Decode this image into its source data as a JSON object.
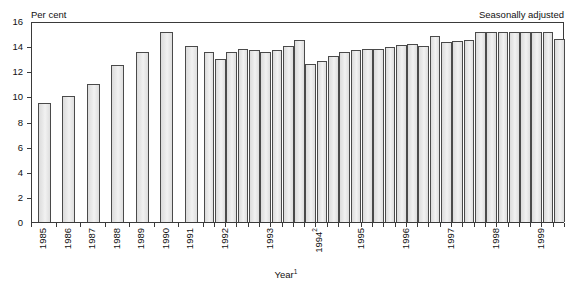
{
  "chart_data": {
    "type": "bar",
    "title": "",
    "note_left": "Per cent",
    "note_right": "Seasonally adjusted",
    "xlabel": "Year",
    "xlabel_superscript": "1",
    "ylabel": "Per cent",
    "ylim": [
      0,
      16
    ],
    "yticks": [
      0,
      2,
      4,
      6,
      8,
      10,
      12,
      14,
      16
    ],
    "ytick_labels": [
      "0",
      "2",
      "4",
      "6",
      "8",
      "10",
      "12",
      "14",
      "16"
    ],
    "grid": false,
    "legend": "none",
    "series_note": "Annual observations 1985-1991, quarterly observations 1992-1999",
    "tick_labels": [
      {
        "label": "1985",
        "superscript": ""
      },
      {
        "label": "1986",
        "superscript": ""
      },
      {
        "label": "1987",
        "superscript": ""
      },
      {
        "label": "1988",
        "superscript": ""
      },
      {
        "label": "1989",
        "superscript": ""
      },
      {
        "label": "1990",
        "superscript": ""
      },
      {
        "label": "1991",
        "superscript": ""
      },
      {
        "label": "1992",
        "superscript": ""
      },
      {
        "label": "1993",
        "superscript": ""
      },
      {
        "label": "1994",
        "superscript": "2"
      },
      {
        "label": "1995",
        "superscript": ""
      },
      {
        "label": "1996",
        "superscript": ""
      },
      {
        "label": "1997",
        "superscript": ""
      },
      {
        "label": "1998",
        "superscript": ""
      },
      {
        "label": "1999",
        "superscript": ""
      }
    ],
    "categories": [
      "1985",
      "1986",
      "1987",
      "1988",
      "1989",
      "1990",
      "1991",
      "1992 Q1",
      "1992 Q2",
      "1992 Q3",
      "1992 Q4",
      "1993 Q1",
      "1993 Q2",
      "1993 Q3",
      "1993 Q4",
      "1994 Q1",
      "1994 Q2",
      "1994 Q3",
      "1994 Q4",
      "1995 Q1",
      "1995 Q2",
      "1995 Q3",
      "1995 Q4",
      "1996 Q1",
      "1996 Q2",
      "1996 Q3",
      "1996 Q4",
      "1997 Q1",
      "1997 Q2",
      "1997 Q3",
      "1997 Q4",
      "1998 Q1",
      "1998 Q2",
      "1998 Q3",
      "1998 Q4",
      "1999 Q1",
      "1999 Q2",
      "1999 Q3",
      "1999 Q4"
    ],
    "values": [
      9.5,
      10.0,
      11.0,
      12.5,
      13.5,
      15.1,
      14.0,
      13.5,
      13.0,
      13.5,
      13.8,
      13.7,
      13.5,
      13.7,
      14.0,
      14.5,
      12.6,
      12.8,
      13.2,
      13.5,
      13.7,
      13.8,
      13.8,
      13.9,
      14.1,
      14.2,
      14.0,
      14.8,
      14.3,
      14.4,
      14.5,
      15.1,
      15.1,
      15.1,
      15.1,
      15.1,
      15.1,
      15.1,
      14.6
    ]
  },
  "layout": {
    "plot_border_color": "#3a3a3a",
    "bar_fill_color": "#e6e6e6",
    "bar_edge_color": "#4a4a4a",
    "background_color": "#ffffff",
    "annual_bar_count": 7
  }
}
